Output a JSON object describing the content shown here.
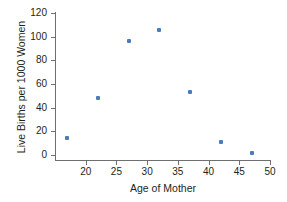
{
  "chart_data": {
    "type": "scatter",
    "title": "",
    "xlabel": "Age of Mother",
    "ylabel": "Live Births per 1000 Women",
    "xlim": [
      15,
      50
    ],
    "ylim": [
      0,
      120
    ],
    "xticks": [
      20,
      25,
      30,
      35,
      40,
      45,
      50
    ],
    "yticks": [
      0,
      20,
      40,
      60,
      80,
      100,
      120
    ],
    "grid": false,
    "legend": null,
    "marker_color": "#4a7ebb",
    "marker_shape": "square",
    "points": [
      {
        "x": 17,
        "y": 14
      },
      {
        "x": 22,
        "y": 48
      },
      {
        "x": 27,
        "y": 96
      },
      {
        "x": 32,
        "y": 106
      },
      {
        "x": 37,
        "y": 53
      },
      {
        "x": 42,
        "y": 11
      },
      {
        "x": 47,
        "y": 2
      }
    ],
    "xtick_labels": [
      "20",
      "25",
      "30",
      "35",
      "40",
      "45",
      "50"
    ],
    "ytick_labels": [
      "0",
      "20",
      "40",
      "60",
      "80",
      "100",
      "120"
    ]
  },
  "colors": {
    "marker": "#4a7ebb",
    "axis": "#6f6f6f",
    "text": "#231f20",
    "background": "#ffffff"
  }
}
